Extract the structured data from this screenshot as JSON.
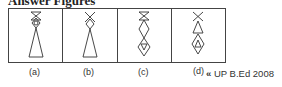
{
  "title": "Answer Figures",
  "figures": [
    {
      "label": "(a)",
      "description": "hourglass top, diamond with circle, large upward triangle"
    },
    {
      "label": "(b)",
      "description": "X top, diamond, large upward triangle"
    },
    {
      "label": "(c)",
      "description": "hourglass top, diamond, diamond containing downward triangle"
    },
    {
      "label": "(d)",
      "description": "X top, upward triangle, diamond containing upward triangle"
    }
  ],
  "source": {
    "mark": "«",
    "text": "UP B.Ed 2008"
  },
  "colors": {
    "stroke": "#333333",
    "border": "#444444"
  }
}
